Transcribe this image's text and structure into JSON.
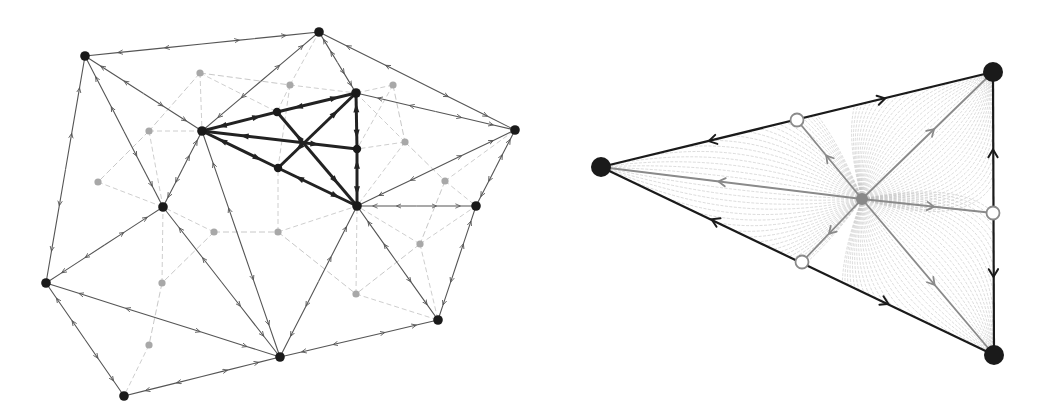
{
  "figure": {
    "colors": {
      "node_black": "#1a1a1a",
      "edge_dark": "#555555",
      "edge_thick": "#222222",
      "edge_light": "#c8c8c8",
      "node_gray": "#a8a8a8",
      "flow_line": "#c4c4c4",
      "gray_axis": "#8a8a8a",
      "open_circle": "#8a8a8a"
    }
  },
  "left_panel": {
    "black_nodes": [
      {
        "id": "A",
        "x": 85,
        "y": 56
      },
      {
        "id": "B",
        "x": 319,
        "y": 32
      },
      {
        "id": "C",
        "x": 202,
        "y": 131
      },
      {
        "id": "D",
        "x": 356,
        "y": 93
      },
      {
        "id": "E",
        "x": 515,
        "y": 130
      },
      {
        "id": "F",
        "x": 163,
        "y": 207
      },
      {
        "id": "G",
        "x": 357,
        "y": 206
      },
      {
        "id": "H",
        "x": 476,
        "y": 206
      },
      {
        "id": "I",
        "x": 46,
        "y": 283
      },
      {
        "id": "J",
        "x": 280,
        "y": 357
      },
      {
        "id": "K",
        "x": 438,
        "y": 320
      },
      {
        "id": "L",
        "x": 124,
        "y": 396
      },
      {
        "id": "M",
        "x": 277,
        "y": 112
      },
      {
        "id": "N",
        "x": 357,
        "y": 149
      },
      {
        "id": "O",
        "x": 278,
        "y": 168
      }
    ],
    "gray_nodes": [
      {
        "x": 200,
        "y": 73
      },
      {
        "x": 290,
        "y": 85
      },
      {
        "x": 393,
        "y": 85
      },
      {
        "x": 149,
        "y": 131
      },
      {
        "x": 405,
        "y": 142
      },
      {
        "x": 98,
        "y": 182
      },
      {
        "x": 445,
        "y": 181
      },
      {
        "x": 214,
        "y": 232
      },
      {
        "x": 278,
        "y": 232
      },
      {
        "x": 162,
        "y": 283
      },
      {
        "x": 420,
        "y": 244
      },
      {
        "x": 356,
        "y": 294
      },
      {
        "x": 149,
        "y": 345
      }
    ],
    "edges": [
      [
        "A",
        "B"
      ],
      [
        "B",
        "E"
      ],
      [
        "A",
        "I"
      ],
      [
        "A",
        "C"
      ],
      [
        "A",
        "F"
      ],
      [
        "B",
        "C"
      ],
      [
        "B",
        "D"
      ],
      [
        "D",
        "E"
      ],
      [
        "E",
        "G"
      ],
      [
        "E",
        "H"
      ],
      [
        "C",
        "F"
      ],
      [
        "C",
        "J"
      ],
      [
        "F",
        "I"
      ],
      [
        "F",
        "J"
      ],
      [
        "I",
        "J"
      ],
      [
        "I",
        "L"
      ],
      [
        "L",
        "J"
      ],
      [
        "J",
        "G"
      ],
      [
        "J",
        "K"
      ],
      [
        "G",
        "K"
      ],
      [
        "G",
        "H"
      ],
      [
        "H",
        "K"
      ]
    ],
    "thick_edges": [
      [
        "C",
        "M"
      ],
      [
        "M",
        "D"
      ],
      [
        "C",
        "N"
      ],
      [
        "C",
        "O"
      ],
      [
        "O",
        "G"
      ],
      [
        "D",
        "N"
      ],
      [
        "N",
        "G"
      ],
      [
        "M",
        "G"
      ],
      [
        "O",
        "D"
      ]
    ]
  },
  "right_panel": {
    "vertices": [
      {
        "id": "left",
        "x": 71,
        "y": 167
      },
      {
        "id": "top_right",
        "x": 463,
        "y": 72
      },
      {
        "id": "bottom_right",
        "x": 464,
        "y": 355
      }
    ],
    "center": {
      "x": 332,
      "y": 199
    },
    "open_circles": [
      {
        "x": 267,
        "y": 120
      },
      {
        "x": 272,
        "y": 262
      },
      {
        "x": 463,
        "y": 213
      }
    ]
  }
}
